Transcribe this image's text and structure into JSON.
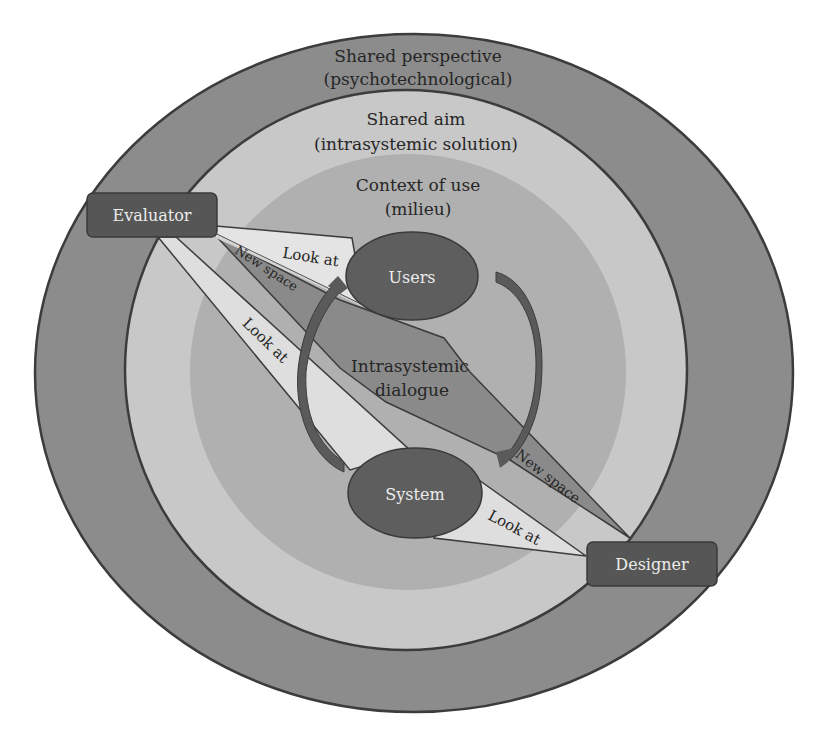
{
  "diagram": {
    "rings": {
      "outer": {
        "title": "Shared perspective",
        "subtitle": "(psychotechnological)"
      },
      "middle": {
        "title": "Shared aim",
        "subtitle": "(intrasystemic solution)"
      },
      "inner": {
        "title": "Context of use",
        "subtitle": "(milieu)"
      }
    },
    "actors": {
      "evaluator": "Evaluator",
      "designer": "Designer"
    },
    "nodes": {
      "users": "Users",
      "system": "System"
    },
    "center_label": {
      "line1": "Intrasystemic",
      "line2": "dialogue"
    },
    "bands": {
      "evaluator_users": "Look at",
      "evaluator_system": "Look at",
      "system_designer": "Look at",
      "evaluator_new_space": "New space",
      "designer_new_space": "New space"
    },
    "colors": {
      "outer_ring": "#8c8c8c",
      "middle_ring": "#c8c8c8",
      "context_circle": "#b0b0b0",
      "actor_box": "#565656",
      "node_ellipse": "#5e5e5e",
      "new_space_band": "#8a8a8a",
      "look_at_band": "#dedede",
      "arrow": "#5a5a5a",
      "outline": "#3c3c3c"
    }
  }
}
